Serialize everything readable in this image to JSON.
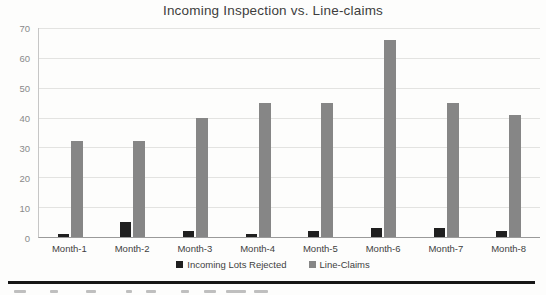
{
  "chart_data": {
    "type": "bar",
    "title": "Incoming Inspection vs. Line-claims",
    "categories": [
      "Month-1",
      "Month-2",
      "Month-3",
      "Month-4",
      "Month-5",
      "Month-6",
      "Month-7",
      "Month-8"
    ],
    "series": [
      {
        "name": "Incoming Lots Rejected",
        "color": "#1f1f1f",
        "values": [
          1,
          5,
          2,
          1,
          2,
          3,
          3,
          2
        ]
      },
      {
        "name": "Line-Claims",
        "color": "#868686",
        "values": [
          32,
          32,
          40,
          45,
          45,
          66,
          45,
          41
        ]
      }
    ],
    "xlabel": "",
    "ylabel": "",
    "ylim": [
      0,
      70
    ],
    "yticks": [
      0,
      10,
      20,
      30,
      40,
      50,
      60,
      70
    ],
    "grid": true,
    "legend_position": "bottom"
  },
  "colors": {
    "background": "#fdfdfc",
    "title_text": "#3d3d3d",
    "axis_line": "#9a9a9a",
    "grid_line": "#e3e3e1",
    "y_tick_text": "#8a8a8a",
    "x_tick_text": "#3f3f3f",
    "divider": "#161616"
  },
  "divider_present": true
}
